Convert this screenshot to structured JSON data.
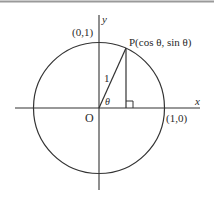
{
  "diagram": {
    "labels": {
      "y_axis": "y",
      "x_axis": "x",
      "top_point": "(0,1)",
      "right_point": "(1,0)",
      "origin": "O",
      "point_p": "P(cos θ, sin θ)",
      "radius": "1",
      "angle": "θ"
    },
    "geometry": {
      "center": [
        99,
        108
      ],
      "radius": 65,
      "point_p": [
        126,
        48
      ],
      "foot": [
        126,
        108
      ]
    },
    "colors": {
      "stroke": "#333333",
      "text": "#2a2a2a",
      "top_border": "#9a9a9a"
    }
  }
}
